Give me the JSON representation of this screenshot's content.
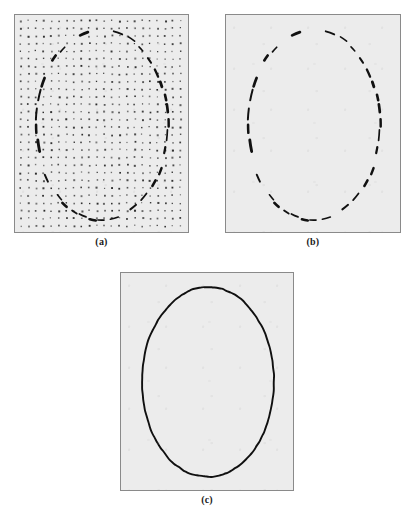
{
  "figure": {
    "type": "multi-panel-image-figure",
    "background_color": "#ffffff",
    "panel_fill_color": "#ececec",
    "panel_border_color": "#8a8a8a",
    "ink_color": "#111111",
    "panels": [
      {
        "id": "a",
        "caption": "(a)",
        "description": "edge-point dot grid with dashed elliptical arc segments",
        "x": 14,
        "y": 14,
        "width": 175,
        "height": 219,
        "has_dot_grid": true,
        "dot_grid": {
          "spacing_x": 7.6,
          "spacing_y": 7.6,
          "dot_size": 1.6,
          "margin": 5
        },
        "ellipse": {
          "cx": 87,
          "cy": 110,
          "rx": 66,
          "ry": 95,
          "rotation_deg": 0
        }
      },
      {
        "id": "b",
        "caption": "(b)",
        "description": "dashed elliptical arc segments only, dot grid removed",
        "x": 225,
        "y": 14,
        "width": 176,
        "height": 219,
        "has_dot_grid": false,
        "ellipse": {
          "cx": 88,
          "cy": 110,
          "rx": 66,
          "ry": 95,
          "rotation_deg": 0
        }
      },
      {
        "id": "c",
        "caption": "(c)",
        "description": "completed continuous closed elliptical contour",
        "x": 120,
        "y": 272,
        "width": 174,
        "height": 219,
        "has_dot_grid": false,
        "ellipse": {
          "cx": 87,
          "cy": 109,
          "rx": 66,
          "ry": 95,
          "rotation_deg": 0
        }
      }
    ]
  },
  "chart_data": {
    "type": "scatter",
    "title": "",
    "xlabel": "",
    "ylabel": "",
    "grid": true,
    "legend_position": "none",
    "panel_captions": [
      "(a)",
      "(b)",
      "(c)"
    ],
    "series": [
      {
        "name": "dot-grid-samples",
        "panel": "a",
        "marker": "square-dot",
        "color": "#2b2b2b",
        "spacing": 7.6,
        "count_approx": 506
      },
      {
        "name": "dashed-ellipse-arcs",
        "panel": "a,b",
        "marker": "arc-segment",
        "color": "#111111",
        "segments_approx": 34,
        "ellipse": {
          "cx": 87,
          "cy": 110,
          "rx": 66,
          "ry": 95
        }
      },
      {
        "name": "closed-ellipse-contour",
        "panel": "c",
        "marker": "continuous-curve",
        "color": "#101010",
        "ellipse": {
          "cx": 87,
          "cy": 109,
          "rx": 66,
          "ry": 95
        }
      }
    ]
  }
}
